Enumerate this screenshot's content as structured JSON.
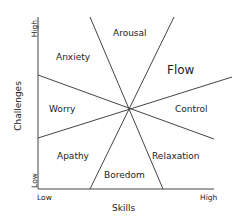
{
  "diagram": {
    "axes": {
      "x": {
        "label": "Skills",
        "low": "Low",
        "high": "High"
      },
      "y": {
        "label": "Challenges",
        "low": "Low",
        "high": "High"
      }
    },
    "regions": {
      "arousal": "Arousal",
      "flow": "Flow",
      "control": "Control",
      "relaxation": "Relaxation",
      "boredom": "Boredom",
      "apathy": "Apathy",
      "worry": "Worry",
      "anxiety": "Anxiety"
    },
    "line_color": "#333333"
  }
}
